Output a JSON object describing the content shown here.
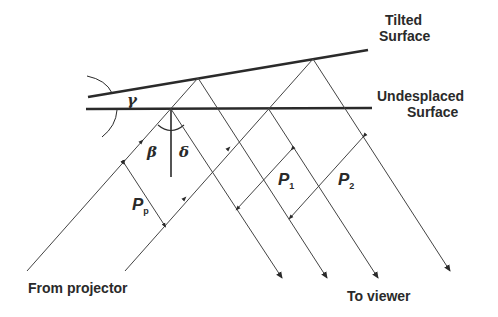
{
  "labels": {
    "tilted_surface_line1": "Tilted",
    "tilted_surface_line2": "Surface",
    "undisplaced_surface_line1": "Undesplaced",
    "undisplaced_surface_line2": "Surface",
    "from_projector": "From projector",
    "to_viewer": "To viewer"
  },
  "symbols": {
    "gamma": "γ",
    "beta": "β",
    "delta": "δ",
    "p_p_main": "P",
    "p_p_sub": "p",
    "p1_main": "P",
    "p1_sub": "1",
    "p2_main": "P",
    "p2_sub": "2"
  },
  "colors": {
    "line": "#2a2a2a",
    "background": "#ffffff"
  }
}
